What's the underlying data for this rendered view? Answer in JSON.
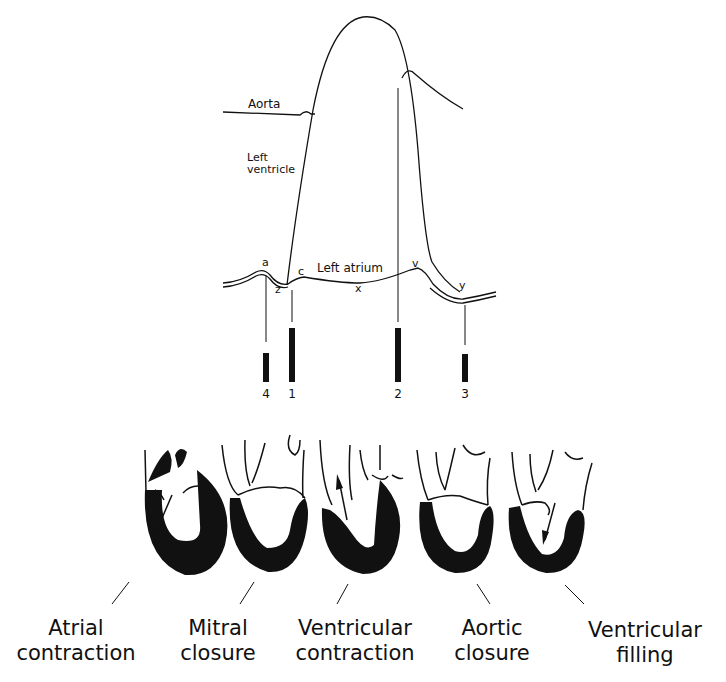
{
  "curves": {
    "aorta_label": "Aorta",
    "ventricle_label_line1": "Left",
    "ventricle_label_line2": "ventricle",
    "atrium_label": "Left atrium"
  },
  "wave_points": {
    "a": "a",
    "c": "c",
    "v": "v",
    "x": "x",
    "y": "y",
    "z": "z"
  },
  "markers": [
    {
      "number": "4",
      "event": "Atrial contraction"
    },
    {
      "number": "1",
      "event": "Mitral closure"
    },
    {
      "number": "2",
      "event": "Aortic closure"
    },
    {
      "number": "3",
      "event": "Ventricular filling"
    }
  ],
  "hearts": [
    {
      "caption_line1": "Atrial",
      "caption_line2": "contraction"
    },
    {
      "caption_line1": "Mitral",
      "caption_line2": "closure"
    },
    {
      "caption_line1": "Ventricular",
      "caption_line2": "contraction"
    },
    {
      "caption_line1": "Aortic",
      "caption_line2": "closure"
    },
    {
      "caption_line1": "Ventricular",
      "caption_line2": "filling"
    }
  ]
}
